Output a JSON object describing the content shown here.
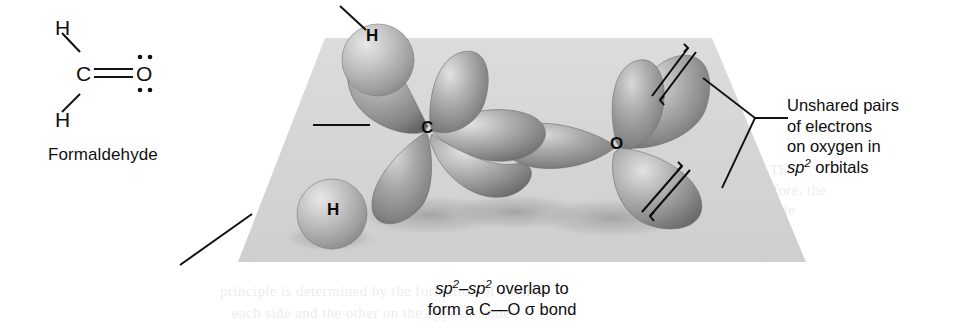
{
  "figure": {
    "plane_color": "#d4d4d4",
    "orbital_color": "#8a8a8a",
    "line_color": "#111111"
  },
  "lewis": {
    "caption": "Formaldehyde",
    "atoms": {
      "h_top": "H",
      "h_bottom": "H",
      "carbon": "C",
      "oxygen": "O"
    },
    "bond_note": "C=O double bond with two lone pairs on oxygen"
  },
  "scene": {
    "atoms": {
      "h_top": "H",
      "h_bottom": "H",
      "carbon": "C",
      "oxygen": "O"
    }
  },
  "annotations": {
    "unshared": {
      "line1": "Unshared pairs",
      "line2": "of electrons",
      "line3": "on oxygen in",
      "line4_pre": "sp",
      "line4_sup": "2",
      "line4_post": " orbitals"
    },
    "overlap": {
      "pre1": "sp",
      "sup1": "2",
      "dash": "–",
      "pre2": "sp",
      "sup2": "2",
      "post": " overlap to",
      "line2_a": "form a C",
      "line2_dash": "—",
      "line2_b": "O ",
      "sigma": "σ",
      "line2_c": " bond"
    }
  },
  "bleed_text": {
    "t1": "unshared pair of electrons",
    "t2": "the plane of the molecule. The",
    "t3": "of the carbon atom. Therefore, the",
    "t4": "how the molecule is flexible",
    "t5": "principle is determined by the formation of a bonds",
    "t6": "each side and the other on the opposite side"
  }
}
